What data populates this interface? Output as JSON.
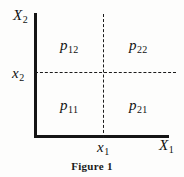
{
  "figure": {
    "caption": "Figure 1",
    "axes": {
      "y_axis_label": "X",
      "y_axis_subscript": "2",
      "x_axis_label": "X",
      "x_axis_subscript": "1"
    },
    "ticks": {
      "y_tick_label": "x",
      "y_tick_subscript": "2",
      "x_tick_label": "x",
      "x_tick_subscript": "1"
    },
    "quadrants": [
      {
        "name": "upper-left",
        "symbol": "p",
        "subscript": "12"
      },
      {
        "name": "upper-right",
        "symbol": "p",
        "subscript": "22"
      },
      {
        "name": "lower-left",
        "symbol": "p",
        "subscript": "11"
      },
      {
        "name": "lower-right",
        "symbol": "p",
        "subscript": "21"
      }
    ],
    "colors": {
      "background": "#fdfdfc",
      "ink": "#151515",
      "dashed_line": "#1b1b1b"
    }
  }
}
